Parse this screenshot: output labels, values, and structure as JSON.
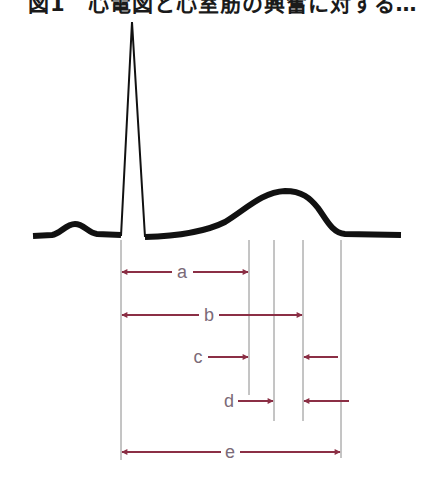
{
  "figure": {
    "title": "図1　心電図と心室筋の興奮に対する…",
    "colors": {
      "waveform": "#111111",
      "guide_lines": "#8a8a8a",
      "arrows": "#8b2f45",
      "labels": "#7b6a78"
    }
  },
  "waveform": {
    "components": [
      "P wave",
      "QRS complex",
      "T wave"
    ],
    "baseline_y": 235
  },
  "intervals": [
    {
      "label": "a",
      "from": "QRS onset",
      "to": "line 1",
      "style": "double-arrow"
    },
    {
      "label": "b",
      "from": "QRS onset",
      "to": "line 3",
      "style": "double-arrow"
    },
    {
      "label": "c",
      "from": "line 1",
      "to": "line 3",
      "style": "converging-arrows"
    },
    {
      "label": "d",
      "from": "line 2",
      "to": "line 3",
      "style": "converging-arrows"
    },
    {
      "label": "e",
      "from": "QRS onset",
      "to": "line 4",
      "style": "double-arrow"
    }
  ],
  "labels": {
    "a": "a",
    "b": "b",
    "c": "c",
    "d": "d",
    "e": "e"
  }
}
